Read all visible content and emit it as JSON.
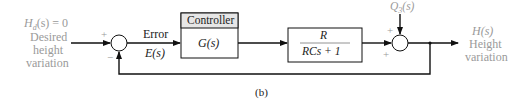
{
  "input": {
    "signal": "H_d(s) = 0",
    "signal_main": "H",
    "signal_sub": "d",
    "signal_rest": "(s) = 0",
    "line1": "Desired",
    "line2": "height",
    "line3": "variation"
  },
  "sum1": {
    "plus": "+",
    "minus": "−"
  },
  "error": {
    "label": "Error",
    "symbol": "E(s)"
  },
  "controller": {
    "title": "Controller",
    "tf": "G(s)"
  },
  "plant": {
    "numerator": "R",
    "denominator": "RCs + 1"
  },
  "disturbance": {
    "main": "Q",
    "sub": "3",
    "rest": "(s)"
  },
  "sum2": {
    "plus_top": "+",
    "plus_left": "+"
  },
  "output": {
    "symbol": "H(s)",
    "line1": "Height",
    "line2": "variation"
  },
  "caption": "(b)",
  "colors": {
    "line": "#111111",
    "gray_text": "#9a9a9a",
    "header_fill": "#e6e6e6"
  }
}
